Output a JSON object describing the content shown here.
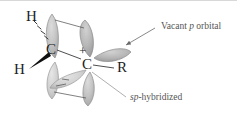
{
  "figure": {
    "width": 237,
    "height": 117,
    "background": "#ffffff",
    "lobe_color_light": "#c9c9c9",
    "lobe_color_mid": "#b0b0b0",
    "lobe_color_dark": "#9e9e9e",
    "lobe_stroke": "#8c8c8c",
    "bond_color": "#3a3a3a",
    "label_color": "#555555",
    "atom_color": "#222222"
  },
  "atoms": {
    "hydrogen_top": "H",
    "hydrogen_left": "H",
    "carbon_left": "C",
    "carbon_right": "C",
    "substituent_r": "R",
    "charge": "+"
  },
  "annotations": {
    "vacant_p_orbital": {
      "prefix": "Vacant ",
      "italic": "p",
      "suffix": " orbital"
    },
    "sp_hybridized": {
      "italic": "sp",
      "suffix": "-hybridized"
    }
  },
  "bonds": [
    {
      "name": "hashed-bond-h-top-to-c-left",
      "style": "hashed"
    },
    {
      "name": "wedge-bond-h-left-to-c-left",
      "style": "wedge"
    },
    {
      "name": "plain-bond-c-left-to-c-right",
      "style": "plain"
    },
    {
      "name": "plain-bond-c-right-to-r",
      "style": "plain"
    }
  ]
}
